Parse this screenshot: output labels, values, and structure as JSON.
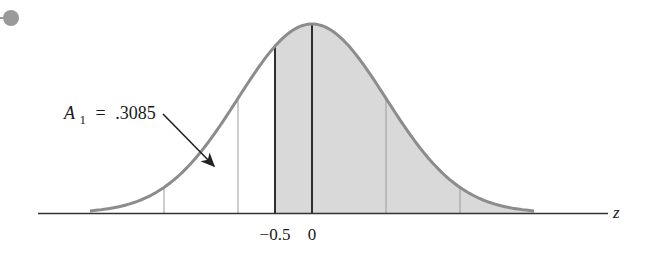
{
  "diagram": {
    "type": "normal-distribution-curve",
    "area_label": {
      "symbol": "A",
      "subscript": "1",
      "equals": "=",
      "value": ".3085"
    },
    "axis": {
      "variable": "z",
      "tick_labels": [
        "−0.5",
        "0"
      ]
    },
    "shaded_region": "z >= -0.5",
    "colors": {
      "curve": "#8c8c8c",
      "shade": "#d6d6d6",
      "axis": "#333333",
      "bullet": "#9a9a9a",
      "text": "#1a1a1a"
    },
    "reference_lines_sigma": [
      -2,
      -1,
      -0.5,
      0,
      1,
      2
    ]
  }
}
